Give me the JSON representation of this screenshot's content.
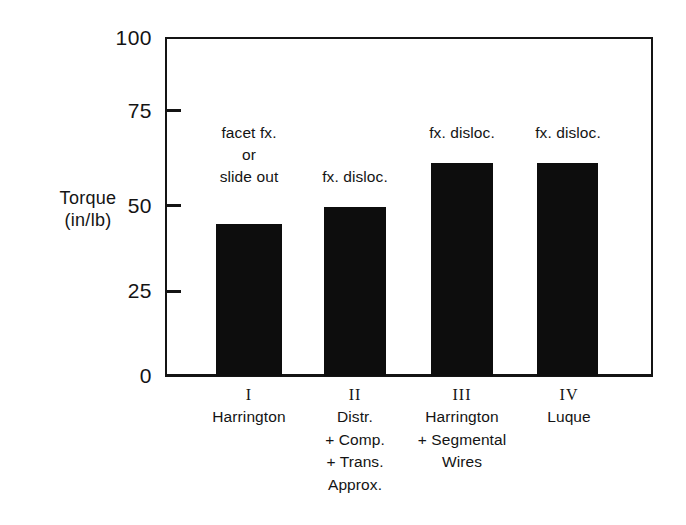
{
  "chart_data": {
    "type": "bar",
    "title": "",
    "subtitle": "",
    "xlabel": "",
    "ylabel": "Torque (in/lb)",
    "ylabel_lines": [
      "Torque",
      "(in/lb)"
    ],
    "ylim": [
      0,
      100
    ],
    "yticks": [
      100,
      75,
      50,
      25,
      0
    ],
    "ytick_labels": [
      "100",
      "75",
      "50",
      "25",
      "0"
    ],
    "grid": false,
    "legend": null,
    "categories": [
      "I",
      "II",
      "III",
      "IV"
    ],
    "category_labels": [
      [
        "Harrington"
      ],
      [
        "Distr.",
        "+ Comp.",
        "+ Trans.",
        "Approx."
      ],
      [
        "Harrington",
        "+ Segmental",
        "Wires"
      ],
      [
        "Luque"
      ]
    ],
    "values": [
      45,
      50,
      63,
      63
    ],
    "annotations": [
      [
        "facet  fx.",
        "or",
        "slide out"
      ],
      [
        "fx. disloc."
      ],
      [
        "fx. disloc."
      ],
      [
        "fx. disloc."
      ]
    ],
    "bar_color": "#0d0d0d",
    "axis_color": "#141414",
    "background_color": "#ffffff"
  }
}
